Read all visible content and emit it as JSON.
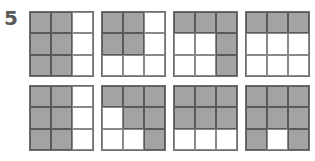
{
  "question_number": "5",
  "colors": {
    "shaded": "#a3a3a3",
    "unshaded": "#ffffff",
    "line": "#5a5a5a"
  },
  "grids": [
    {
      "pattern": [
        [
          1,
          1,
          0
        ],
        [
          1,
          1,
          0
        ],
        [
          1,
          1,
          0
        ]
      ]
    },
    {
      "pattern": [
        [
          1,
          1,
          0
        ],
        [
          1,
          1,
          0
        ],
        [
          0,
          0,
          0
        ]
      ]
    },
    {
      "pattern": [
        [
          1,
          1,
          1
        ],
        [
          0,
          0,
          1
        ],
        [
          0,
          0,
          1
        ]
      ]
    },
    {
      "pattern": [
        [
          1,
          1,
          1
        ],
        [
          0,
          0,
          0
        ],
        [
          0,
          0,
          0
        ]
      ]
    },
    {
      "pattern": [
        [
          1,
          1,
          0
        ],
        [
          1,
          1,
          0
        ],
        [
          1,
          1,
          0
        ]
      ]
    },
    {
      "pattern": [
        [
          1,
          1,
          1
        ],
        [
          0,
          1,
          1
        ],
        [
          0,
          0,
          1
        ]
      ]
    },
    {
      "pattern": [
        [
          1,
          1,
          1
        ],
        [
          1,
          1,
          1
        ],
        [
          0,
          0,
          0
        ]
      ]
    },
    {
      "pattern": [
        [
          1,
          1,
          1
        ],
        [
          1,
          1,
          1
        ],
        [
          1,
          0,
          1
        ]
      ]
    }
  ]
}
